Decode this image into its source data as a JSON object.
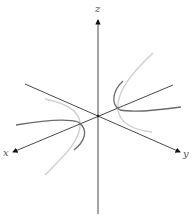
{
  "diagram": {
    "type": "3d-coordinate-axes-with-hyperbolic-curves",
    "axes": {
      "x": {
        "label": "x"
      },
      "y": {
        "label": "y"
      },
      "z": {
        "label": "z"
      }
    },
    "colors": {
      "axis": "#333333",
      "curve_dark": "#666666",
      "curve_light": "#cccccc",
      "label": "#555555"
    }
  }
}
